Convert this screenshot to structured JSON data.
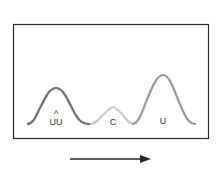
{
  "diagram": {
    "type": "chromatogram",
    "peaks": [
      {
        "label": "UU",
        "accent": "^",
        "color": "#6f6f6f",
        "height": "medium"
      },
      {
        "label": "C",
        "color": "#c8c8c8",
        "height": "small"
      },
      {
        "label": "U",
        "color": "#9a9a9a",
        "height": "large"
      }
    ],
    "arrow": {
      "direction": "right"
    },
    "colors": {
      "frame": "#2a2a2a",
      "arrow": "#2a2a2a"
    }
  }
}
